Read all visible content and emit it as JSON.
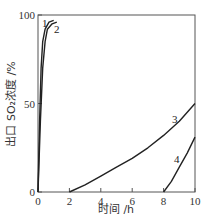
{
  "chart_data": {
    "type": "line",
    "title": "",
    "xlabel": "时间 /h",
    "ylabel": "出口 SO₂浓度 /%",
    "xlim": [
      0,
      10
    ],
    "ylim": [
      0,
      100
    ],
    "x_ticks": [
      "0",
      "2",
      "4",
      "6",
      "8",
      "10"
    ],
    "y_ticks": [
      "0",
      "50",
      "100"
    ],
    "grid": false,
    "legend": "inline curve labels",
    "series": [
      {
        "name": "1",
        "x": [
          0,
          0.1,
          0.2,
          0.3,
          0.45,
          0.7,
          1.0
        ],
        "y": [
          0,
          40,
          70,
          85,
          92,
          96,
          97
        ]
      },
      {
        "name": "2",
        "x": [
          0,
          0.15,
          0.3,
          0.45,
          0.6,
          0.9,
          1.2
        ],
        "y": [
          0,
          40,
          70,
          85,
          92,
          95,
          96
        ]
      },
      {
        "name": "3",
        "x": [
          2,
          3,
          4,
          5,
          6,
          7,
          8,
          9,
          10
        ],
        "y": [
          0,
          4,
          9,
          14,
          19,
          25,
          32,
          40,
          50
        ]
      },
      {
        "name": "4",
        "x": [
          8,
          8.5,
          9,
          9.5,
          10
        ],
        "y": [
          0,
          6,
          14,
          22,
          31
        ]
      }
    ]
  }
}
